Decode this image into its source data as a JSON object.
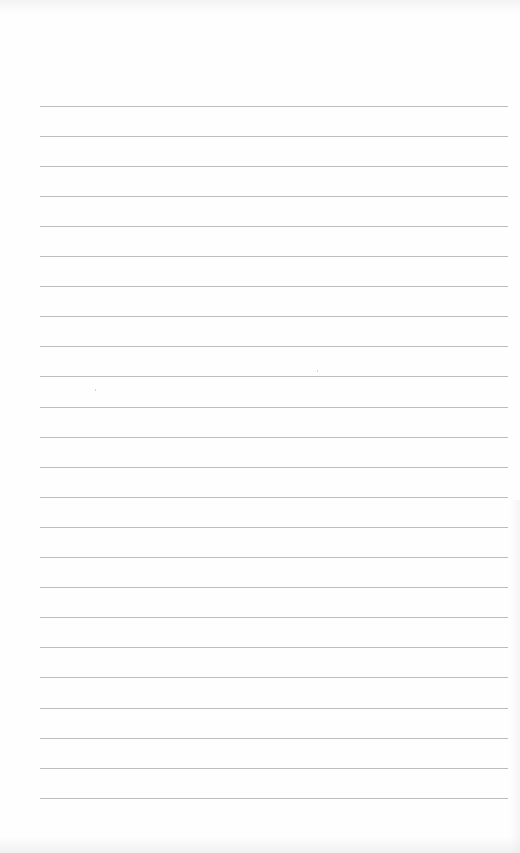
{
  "page": {
    "type": "lined-paper",
    "background_color": "#fefefe",
    "rule_color": "#bdbdbd",
    "rule_count": 24,
    "rule_left": 40,
    "rule_right": 508,
    "first_rule_y": 105.5,
    "rule_spacing": 30.1
  }
}
